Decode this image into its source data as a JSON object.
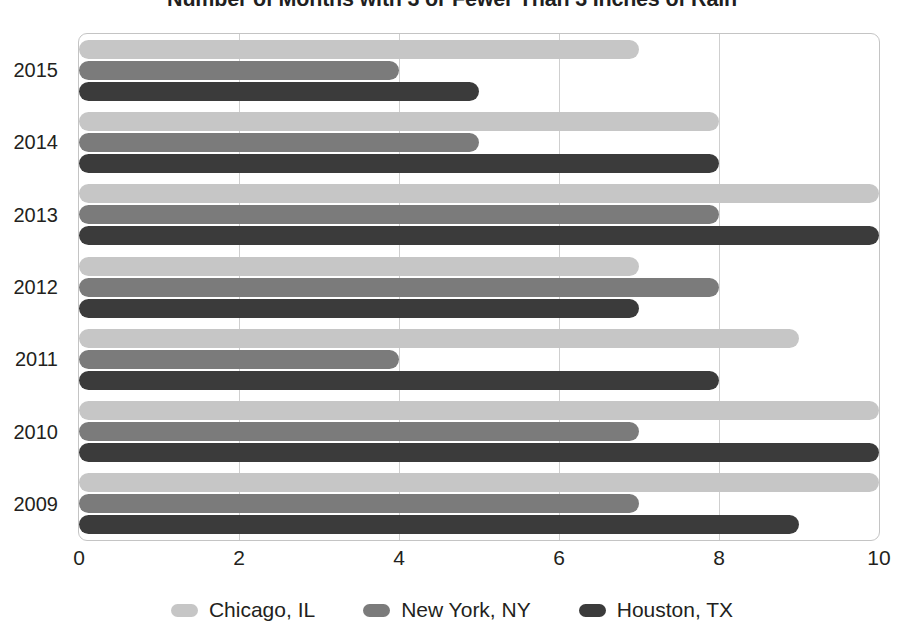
{
  "chart_data": {
    "type": "bar",
    "orientation": "horizontal",
    "title": "Number of Months with 3 or Fewer Than 3 Inches of Rain",
    "xlabel": "",
    "ylabel": "",
    "categories": [
      "2015",
      "2014",
      "2013",
      "2012",
      "2011",
      "2010",
      "2009"
    ],
    "series": [
      {
        "name": "Chicago, IL",
        "color": "#c6c6c6",
        "values": [
          7,
          8,
          10,
          7,
          9,
          10,
          10
        ]
      },
      {
        "name": "New York, NY",
        "color": "#7b7b7b",
        "values": [
          4,
          5,
          8,
          8,
          4,
          7,
          7
        ]
      },
      {
        "name": "Houston, TX",
        "color": "#3b3b3b",
        "values": [
          5,
          8,
          10,
          7,
          8,
          10,
          9
        ]
      }
    ],
    "xlim": [
      0,
      10
    ],
    "xticks": [
      "0",
      "2",
      "4",
      "6",
      "8",
      "10"
    ],
    "xtick_values": [
      0,
      2,
      4,
      6,
      8,
      10
    ],
    "grid": "vertical",
    "legend_position": "bottom"
  }
}
